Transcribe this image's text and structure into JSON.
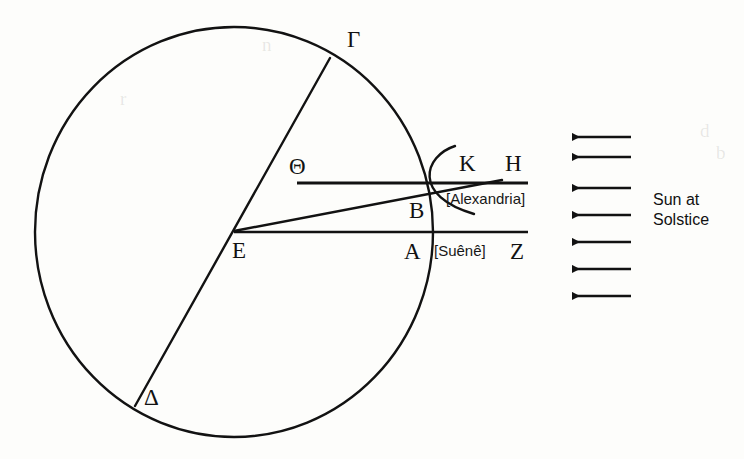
{
  "figure": {
    "type": "geometric-diagram",
    "background_color": "#fdfdfb",
    "ink_color": "#121212"
  },
  "labels": {
    "gamma": "Γ",
    "delta": "Δ",
    "theta": "Θ",
    "epsilon": "E",
    "alpha": "A",
    "beta": "B",
    "kappa": "K",
    "eta": "H",
    "zeta": "Z"
  },
  "annotations": {
    "alexandria": "[Alexandria]",
    "syene": "[Suênê]",
    "sun_line1": "Sun at",
    "sun_line2": "Solstice"
  },
  "geometry": {
    "earth_circle": {
      "cx": 234,
      "cy": 232,
      "rx": 199,
      "ry": 205
    },
    "diameter_gamma_delta": {
      "x1": 330,
      "y1": 58,
      "x2": 135,
      "y2": 406
    },
    "line_theta_h": {
      "x1": 297,
      "y1": 183,
      "x2": 528,
      "y2": 183
    },
    "line_e_z": {
      "x1": 234,
      "y1": 232,
      "x2": 528,
      "y2": 232
    },
    "ray_e_k": {
      "x1": 234,
      "y1": 231,
      "x2": 500,
      "y2": 180
    },
    "angle_arc": {
      "start_x": 455,
      "start_y": 146,
      "ctrl_x": 416,
      "ctrl_y": 182,
      "end_x": 474,
      "end_y": 214
    }
  },
  "sun_rays": {
    "count": 7,
    "direction": "leftward",
    "x_tail": 631,
    "x_head": 566,
    "y_positions": [
      137,
      157,
      188,
      215,
      242,
      269,
      296
    ]
  },
  "watermark_text": {
    "items": [
      {
        "text": "d",
        "x": 700,
        "y": 128
      },
      {
        "text": "b",
        "x": 716,
        "y": 150
      },
      {
        "text": "r",
        "x": 120,
        "y": 96
      },
      {
        "text": "n",
        "x": 262,
        "y": 42
      }
    ]
  }
}
